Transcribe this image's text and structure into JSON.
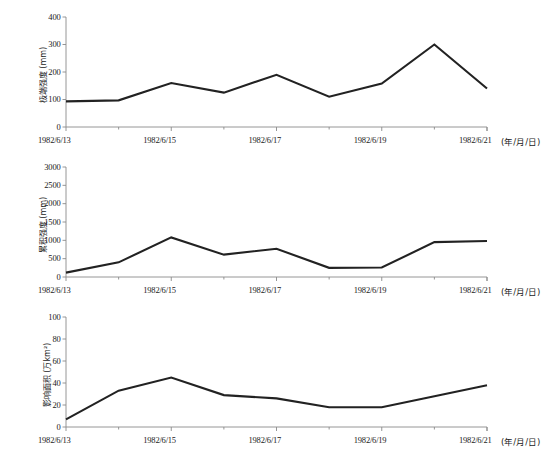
{
  "figure": {
    "background": "#ffffff",
    "line_color": "#222222",
    "axis_color": "#8a8a8a",
    "text_color": "#1a1a1a"
  },
  "axis_unit_note": "(年/月/日)",
  "chart_data": [
    {
      "type": "line",
      "title": "",
      "subtitle": "",
      "xlabel": "(年/月/日)",
      "ylabel": "极端强度 (mm)",
      "x": [
        "1982/6/13",
        "1982/6/14",
        "1982/6/15",
        "1982/6/16",
        "1982/6/17",
        "1982/6/18",
        "1982/6/19",
        "1982/6/20",
        "1982/6/21"
      ],
      "xtick_labels": [
        "1982/6/13",
        "1982/6/15",
        "1982/6/17",
        "1982/6/19",
        "1982/6/21"
      ],
      "ytick_labels": [
        "0",
        "100",
        "200",
        "300",
        "400"
      ],
      "yticks": [
        0,
        100,
        200,
        300,
        400
      ],
      "values": [
        93,
        97,
        160,
        125,
        190,
        110,
        158,
        300,
        140
      ],
      "ylim": [
        0,
        400
      ],
      "grid": false,
      "legend": null,
      "series_name": "极端强度"
    },
    {
      "type": "line",
      "title": "",
      "subtitle": "",
      "xlabel": "(年/月/日)",
      "ylabel": "累积强度 (mm)",
      "x": [
        "1982/6/13",
        "1982/6/14",
        "1982/6/15",
        "1982/6/16",
        "1982/6/17",
        "1982/6/18",
        "1982/6/19",
        "1982/6/20",
        "1982/6/21"
      ],
      "xtick_labels": [
        "1982/6/13",
        "1982/6/15",
        "1982/6/17",
        "1982/6/19",
        "1982/6/21"
      ],
      "ytick_labels": [
        "0",
        "500",
        "1000",
        "1500",
        "2000",
        "2500",
        "3000"
      ],
      "yticks": [
        0,
        500,
        1000,
        1500,
        2000,
        2500,
        3000
      ],
      "values": [
        120,
        400,
        1080,
        610,
        770,
        250,
        260,
        950,
        980
      ],
      "ylim": [
        0,
        3000
      ],
      "grid": false,
      "legend": null,
      "series_name": "累积强度"
    },
    {
      "type": "line",
      "title": "",
      "subtitle": "",
      "xlabel": "(年/月/日)",
      "ylabel": "影响面积 (万km²)",
      "x": [
        "1982/6/13",
        "1982/6/14",
        "1982/6/15",
        "1982/6/16",
        "1982/6/17",
        "1982/6/18",
        "1982/6/19",
        "1982/6/20",
        "1982/6/21"
      ],
      "xtick_labels": [
        "1982/6/13",
        "1982/6/15",
        "1982/6/17",
        "1982/6/19",
        "1982/6/21"
      ],
      "ytick_labels": [
        "0",
        "20",
        "40",
        "60",
        "80",
        "100"
      ],
      "yticks": [
        0,
        20,
        40,
        60,
        80,
        100
      ],
      "values": [
        7,
        33,
        45,
        29,
        26,
        18,
        18,
        28,
        38
      ],
      "ylim": [
        0,
        100
      ],
      "grid": false,
      "legend": null,
      "series_name": "影响面积"
    }
  ]
}
